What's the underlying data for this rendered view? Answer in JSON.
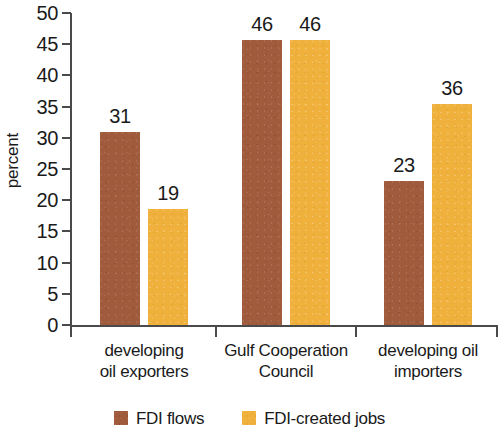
{
  "chart_data": {
    "type": "bar",
    "title": "",
    "subtitle": "",
    "xlabel": "",
    "ylabel": "percent",
    "ylim": [
      0,
      50
    ],
    "y_ticks": [
      0,
      5,
      10,
      15,
      20,
      25,
      30,
      35,
      40,
      45,
      50
    ],
    "grid": false,
    "legend_position": "bottom",
    "categories": [
      "developing oil exporters",
      "Gulf Cooperation Council",
      "developing oil importers"
    ],
    "category_lines": [
      [
        "developing",
        "oil exporters"
      ],
      [
        "Gulf Cooperation",
        "Council"
      ],
      [
        "developing oil",
        "importers"
      ]
    ],
    "series": [
      {
        "name": "FDI flows",
        "color": "#a05a3c",
        "values": [
          31,
          46,
          23
        ],
        "plotted_values": [
          31.0,
          45.6,
          23.0
        ],
        "labels": [
          "31",
          "46",
          "23"
        ]
      },
      {
        "name": "FDI-created jobs",
        "color": "#f0b03c",
        "values": [
          19,
          46,
          36
        ],
        "plotted_values": [
          18.6,
          45.6,
          35.4
        ],
        "labels": [
          "19",
          "46",
          "36"
        ]
      }
    ]
  },
  "colors": {
    "series_flows": "#a05a3c",
    "series_jobs": "#f0b03c",
    "axis": "#4a4a4a",
    "text": "#1a1a1a",
    "background": "#ffffff"
  }
}
